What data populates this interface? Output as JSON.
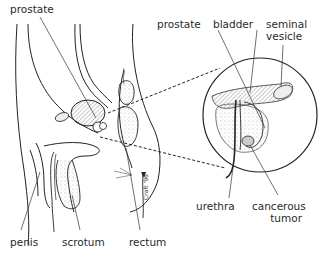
{
  "diagram": {
    "colors": {
      "line": "#222222",
      "shading": "#9a9a9a",
      "text": "#2a2a2a",
      "background": "#ffffff"
    },
    "labels": {
      "prostate_left": "prostate",
      "prostate_inset": "prostate",
      "bladder": "bladder",
      "seminal_vesicle_1": "seminal",
      "seminal_vesicle_2": "vesicle",
      "urethra": "urethra",
      "cancerous_tumor_1": "cancerous",
      "cancerous_tumor_2": "tumor",
      "penis": "penis",
      "scrotum": "scrotum",
      "rectum": "rectum"
    },
    "signature": "Craft '96"
  }
}
